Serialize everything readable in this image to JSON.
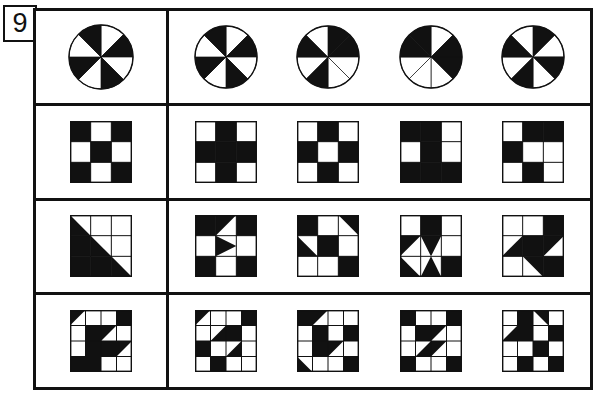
{
  "item": {
    "number": "9",
    "type": "figure-analogy-matrix",
    "rows": 4,
    "options_per_row": 4
  },
  "puzzle": {
    "title": "Item 9 — nonverbal pattern matching",
    "description": "Four rows; each row shows one stem figure at left and four answer-option figures at right.",
    "colors": {
      "ink": "#111111",
      "paper": "#ffffff"
    },
    "rows": [
      {
        "id": "row-1",
        "stem": {
          "name": "pie-8-sector-pinwheel",
          "shape": "circle",
          "sectors": 8,
          "filled_sectors": [
            1,
            3,
            5,
            7
          ],
          "label": "Circle divided into 8 equal sectors, alternating black and white"
        },
        "options": [
          {
            "name": "pie-8-sector-alternating",
            "shape": "circle",
            "sectors": 8,
            "filled_sectors": [
              1,
              3,
              5,
              7
            ],
            "label": "Option A"
          },
          {
            "name": "pie-8-sector-uneven",
            "shape": "circle",
            "sectors": 8,
            "filled_sectors": [
              0,
              1,
              4,
              6
            ],
            "label": "Option B"
          },
          {
            "name": "pie-4-sector-diagonal",
            "shape": "circle",
            "sectors": 8,
            "filled_sectors": [
              1,
              2,
              6,
              7
            ],
            "label": "Option C"
          },
          {
            "name": "pie-8-sector-alternating-rotated",
            "shape": "circle",
            "sectors": 8,
            "filled_sectors": [
              0,
              2,
              4,
              6
            ],
            "label": "Option D"
          }
        ]
      },
      {
        "id": "row-2",
        "stem": {
          "name": "grid3-checkerboard",
          "shape": "grid3",
          "cells": [
            1,
            0,
            1,
            0,
            1,
            0,
            1,
            0,
            1
          ],
          "label": "3 by 3 checkerboard, corners and centre black"
        },
        "options": [
          {
            "name": "grid3-plus-cross",
            "shape": "grid3",
            "cells": [
              0,
              1,
              0,
              1,
              1,
              1,
              0,
              1,
              0
            ],
            "label": "Option A"
          },
          {
            "name": "grid3-checkerboard-inverted",
            "shape": "grid3",
            "cells": [
              0,
              1,
              0,
              1,
              0,
              1,
              0,
              1,
              0
            ],
            "label": "Option B"
          },
          {
            "name": "grid3-block-notch",
            "shape": "grid3",
            "cells": [
              1,
              1,
              0,
              0,
              1,
              0,
              1,
              1,
              1
            ],
            "label": "Option C"
          },
          {
            "name": "grid3-step",
            "shape": "grid3",
            "cells": [
              0,
              1,
              1,
              1,
              0,
              0,
              0,
              1,
              0
            ],
            "label": "Option D"
          }
        ]
      },
      {
        "id": "row-3",
        "stem": {
          "name": "grid3-lower-left-triangle",
          "shape": "grid3-tri",
          "tiles": [
            {
              "r": 0,
              "c": 0,
              "t": "tri-bl"
            },
            {
              "r": 1,
              "c": 0,
              "t": "full"
            },
            {
              "r": 1,
              "c": 1,
              "t": "tri-bl"
            },
            {
              "r": 2,
              "c": 0,
              "t": "full"
            },
            {
              "r": 2,
              "c": 1,
              "t": "full"
            },
            {
              "r": 2,
              "c": 2,
              "t": "tri-bl"
            }
          ],
          "label": "3 by 3 grid with a large black triangle over the lower-left half"
        },
        "options": [
          {
            "name": "grid3-arrow-right",
            "shape": "grid3-tri",
            "tiles": [
              {
                "r": 0,
                "c": 0,
                "t": "full"
              },
              {
                "r": 0,
                "c": 1,
                "t": "tri-tl"
              },
              {
                "r": 0,
                "c": 2,
                "t": "full"
              },
              {
                "r": 1,
                "c": 1,
                "t": "tri-left"
              },
              {
                "r": 2,
                "c": 0,
                "t": "full"
              },
              {
                "r": 2,
                "c": 2,
                "t": "full"
              }
            ],
            "label": "Option A"
          },
          {
            "name": "grid3-diagonal-band",
            "shape": "grid3-tri",
            "tiles": [
              {
                "r": 0,
                "c": 0,
                "t": "full"
              },
              {
                "r": 0,
                "c": 2,
                "t": "tri-tr"
              },
              {
                "r": 1,
                "c": 0,
                "t": "tri-bl"
              },
              {
                "r": 1,
                "c": 1,
                "t": "full"
              },
              {
                "r": 2,
                "c": 2,
                "t": "full"
              }
            ],
            "label": "Option B"
          },
          {
            "name": "grid3-diamond",
            "shape": "grid3-tri",
            "tiles": [
              {
                "r": 0,
                "c": 1,
                "t": "full"
              },
              {
                "r": 1,
                "c": 0,
                "t": "tri-tl"
              },
              {
                "r": 1,
                "c": 1,
                "t": "tri-tl-tr"
              },
              {
                "r": 2,
                "c": 0,
                "t": "tri-bl-inv"
              },
              {
                "r": 2,
                "c": 1,
                "t": "tri-bl-br"
              },
              {
                "r": 2,
                "c": 2,
                "t": "full"
              },
              {
                "r": 1,
                "c": 2,
                "t": "none"
              }
            ],
            "label": "Option C"
          },
          {
            "name": "grid3-check-arrow",
            "shape": "grid3-tri",
            "tiles": [
              {
                "r": 0,
                "c": 2,
                "t": "full"
              },
              {
                "r": 1,
                "c": 0,
                "t": "tri-br"
              },
              {
                "r": 1,
                "c": 1,
                "t": "full"
              },
              {
                "r": 1,
                "c": 2,
                "t": "tri-tl"
              },
              {
                "r": 2,
                "c": 1,
                "t": "tri-tr"
              },
              {
                "r": 2,
                "c": 2,
                "t": "full"
              }
            ],
            "label": "Option D"
          }
        ]
      },
      {
        "id": "row-4",
        "stem": {
          "name": "grid4-diagonal-wedge",
          "shape": "grid4-tri",
          "tiles": [
            {
              "r": 0,
              "c": 0,
              "t": "tri-tl"
            },
            {
              "r": 0,
              "c": 3,
              "t": "full"
            },
            {
              "r": 1,
              "c": 1,
              "t": "full"
            },
            {
              "r": 1,
              "c": 2,
              "t": "tri-tl"
            },
            {
              "r": 2,
              "c": 1,
              "t": "full"
            },
            {
              "r": 2,
              "c": 2,
              "t": "full"
            },
            {
              "r": 2,
              "c": 3,
              "t": "tri-tl"
            },
            {
              "r": 3,
              "c": 0,
              "t": "full"
            },
            {
              "r": 3,
              "c": 1,
              "t": "full"
            }
          ],
          "label": "4 by 4 grid with a black diagonal wedge through the middle"
        },
        "options": [
          {
            "name": "grid4-option-a",
            "shape": "grid4-tri",
            "tiles": [
              {
                "r": 0,
                "c": 0,
                "t": "tri-tl"
              },
              {
                "r": 0,
                "c": 3,
                "t": "full"
              },
              {
                "r": 1,
                "c": 1,
                "t": "tri-br"
              },
              {
                "r": 1,
                "c": 2,
                "t": "full"
              },
              {
                "r": 2,
                "c": 0,
                "t": "full"
              },
              {
                "r": 2,
                "c": 2,
                "t": "tri-br"
              },
              {
                "r": 3,
                "c": 1,
                "t": "full"
              }
            ],
            "label": "Option A"
          },
          {
            "name": "grid4-option-b",
            "shape": "grid4-tri",
            "tiles": [
              {
                "r": 0,
                "c": 0,
                "t": "full"
              },
              {
                "r": 0,
                "c": 1,
                "t": "tri-tl"
              },
              {
                "r": 1,
                "c": 1,
                "t": "full"
              },
              {
                "r": 1,
                "c": 3,
                "t": "full"
              },
              {
                "r": 2,
                "c": 1,
                "t": "full"
              },
              {
                "r": 2,
                "c": 2,
                "t": "tri-tl"
              },
              {
                "r": 3,
                "c": 0,
                "t": "tri-bl"
              },
              {
                "r": 3,
                "c": 3,
                "t": "full"
              }
            ],
            "label": "Option B"
          },
          {
            "name": "grid4-option-c",
            "shape": "grid4-tri",
            "tiles": [
              {
                "r": 0,
                "c": 0,
                "t": "full"
              },
              {
                "r": 0,
                "c": 3,
                "t": "full"
              },
              {
                "r": 1,
                "c": 1,
                "t": "full"
              },
              {
                "r": 1,
                "c": 2,
                "t": "tri-tl"
              },
              {
                "r": 2,
                "c": 1,
                "t": "tri-br"
              },
              {
                "r": 2,
                "c": 2,
                "t": "tri-tl"
              },
              {
                "r": 3,
                "c": 0,
                "t": "full"
              },
              {
                "r": 3,
                "c": 3,
                "t": "full"
              }
            ],
            "label": "Option C"
          },
          {
            "name": "grid4-option-d",
            "shape": "grid4-tri",
            "tiles": [
              {
                "r": 0,
                "c": 1,
                "t": "full"
              },
              {
                "r": 0,
                "c": 2,
                "t": "tri-tr"
              },
              {
                "r": 1,
                "c": 0,
                "t": "tri-br"
              },
              {
                "r": 1,
                "c": 1,
                "t": "full"
              },
              {
                "r": 1,
                "c": 3,
                "t": "full"
              },
              {
                "r": 2,
                "c": 2,
                "t": "full"
              },
              {
                "r": 3,
                "c": 1,
                "t": "full"
              },
              {
                "r": 3,
                "c": 3,
                "t": "full"
              }
            ],
            "label": "Option D"
          }
        ]
      }
    ]
  }
}
